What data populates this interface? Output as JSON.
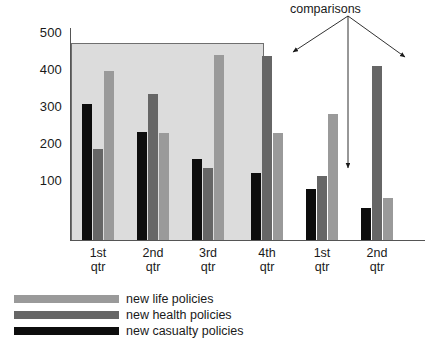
{
  "chart_data": {
    "type": "bar",
    "title": "",
    "xlabel": "",
    "ylabel": "",
    "ylim": [
      0,
      500
    ],
    "yticks": [
      100,
      200,
      300,
      400,
      500
    ],
    "grid": false,
    "legend_position": "bottom-left",
    "categories": [
      "1st qtr",
      "2nd qtr",
      "3rd qtr",
      "4th qtr",
      "1st qtr",
      "2nd qtr"
    ],
    "category_lines": [
      {
        "l1": "1st",
        "l2": "qtr"
      },
      {
        "l1": "2nd",
        "l2": "qtr"
      },
      {
        "l1": "3rd",
        "l2": "qtr"
      },
      {
        "l1": "4th",
        "l2": "qtr"
      },
      {
        "l1": "1st",
        "l2": "qtr"
      },
      {
        "l1": "2nd",
        "l2": "qtr"
      }
    ],
    "series": [
      {
        "name": "new casualty policies",
        "key": "casualty",
        "color": "#0d0d0d",
        "values": [
          305,
          229,
          157,
          118,
          73,
          22
        ]
      },
      {
        "name": "new health policies",
        "key": "health",
        "color": "#666666",
        "values": [
          183,
          333,
          132,
          436,
          110,
          409
        ]
      },
      {
        "name": "new life policies",
        "key": "life",
        "color": "#9a9a9a",
        "values": [
          396,
          226,
          439,
          228,
          278,
          50
        ]
      }
    ],
    "series_draw_order": [
      "casualty",
      "health",
      "life"
    ],
    "annotations": [
      {
        "text": "comparisons",
        "targets": [
          "4th qtr health bar",
          "1st qtr health bar",
          "2nd qtr health bar"
        ]
      }
    ],
    "highlight_region": {
      "label": "shaded box over first three quarters",
      "covers_categories": [
        "1st qtr",
        "2nd qtr",
        "3rd qtr"
      ],
      "fill": "#dcdcdc",
      "top_value": 450
    }
  },
  "legend": {
    "items": [
      {
        "label": "new life policies",
        "key": "life",
        "color": "#9a9a9a"
      },
      {
        "label": "new health policies",
        "key": "health",
        "color": "#666666"
      },
      {
        "label": "new casualty policies",
        "key": "casualty",
        "color": "#0d0d0d"
      }
    ]
  },
  "axis": {
    "yticks": [
      {
        "label": "500"
      },
      {
        "label": "400"
      },
      {
        "label": "300"
      },
      {
        "label": "200"
      },
      {
        "label": "100"
      }
    ]
  },
  "annotation": {
    "label": "comparisons"
  },
  "colors": {
    "life": "#9a9a9a",
    "health": "#666666",
    "casualty": "#0d0d0d",
    "shade": "#dcdcdc",
    "axis": "#555555",
    "text": "#1a1a1a",
    "background": "#ffffff"
  }
}
